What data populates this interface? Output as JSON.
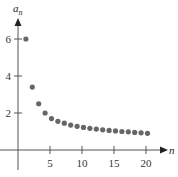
{
  "chart_data": {
    "type": "scatter",
    "title": "",
    "xlabel": "n",
    "ylabel": "a_n",
    "ylabel_main": "a",
    "ylabel_sub": "n",
    "x": [
      1,
      2,
      3,
      4,
      5,
      6,
      7,
      8,
      9,
      10,
      11,
      12,
      13,
      14,
      15,
      16,
      17,
      18,
      19,
      20
    ],
    "values": [
      6,
      3.4,
      2.5,
      2.0,
      1.7,
      1.55,
      1.45,
      1.35,
      1.28,
      1.22,
      1.17,
      1.13,
      1.09,
      1.06,
      1.03,
      1.0,
      0.98,
      0.95,
      0.93,
      0.9
    ],
    "xticks": [
      5,
      10,
      15,
      20
    ],
    "xtick_labels": [
      "5",
      "10",
      "15",
      "20"
    ],
    "yticks": [
      2,
      4,
      6
    ],
    "ytick_labels": [
      "2",
      "4",
      "6"
    ],
    "xlim": [
      0,
      23
    ],
    "ylim": [
      0,
      7
    ],
    "grid": false,
    "legend": null,
    "colors": {
      "point": "#666666",
      "axis": "#555555",
      "text": "#333333"
    }
  }
}
